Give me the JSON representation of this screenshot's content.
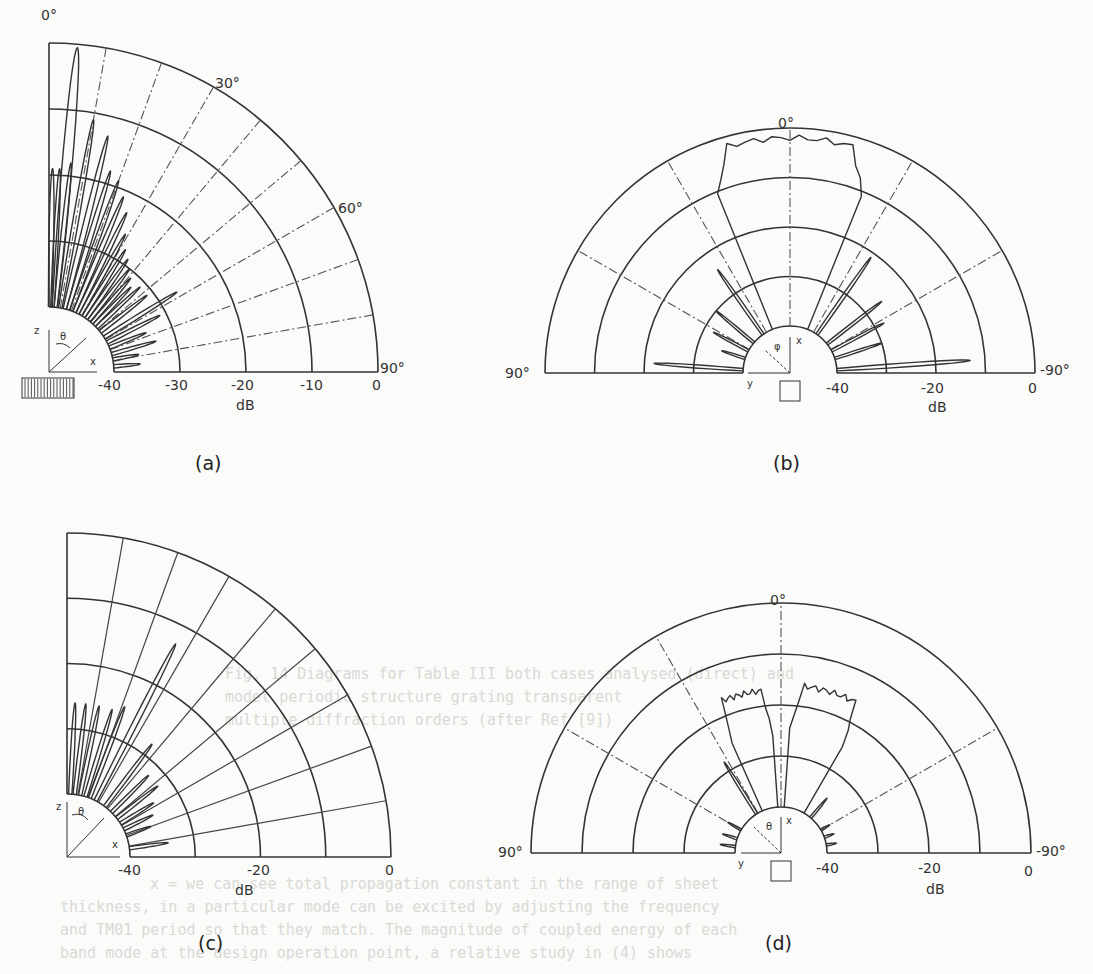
{
  "chart_data": [
    {
      "id": "a",
      "type": "polar",
      "panel_label": "(a)",
      "layout": "quarter",
      "angle_range_deg": [
        0,
        90
      ],
      "angle_labels": [
        "0°",
        "30°",
        "60°",
        "90°"
      ],
      "radial_unit": "dB",
      "radial_ticks": [
        "-40",
        "-30",
        "-20",
        "-10",
        "0"
      ],
      "rlim": [
        -40,
        0
      ],
      "grid": true,
      "inset": {
        "axes": [
          "z",
          "x"
        ],
        "angle": "θ",
        "icon": "hatched-slab"
      },
      "lobes": [
        {
          "theta": 5,
          "db": -0.5
        },
        {
          "theta": 1,
          "db": -19
        },
        {
          "theta": 3,
          "db": -19
        },
        {
          "theta": 6,
          "db": -18
        },
        {
          "theta": 10,
          "db": -11
        },
        {
          "theta": 14,
          "db": -13
        },
        {
          "theta": 17,
          "db": -18
        },
        {
          "theta": 20,
          "db": -19
        },
        {
          "theta": 23,
          "db": -21
        },
        {
          "theta": 26,
          "db": -23
        },
        {
          "theta": 29,
          "db": -26
        },
        {
          "theta": 32,
          "db": -28
        },
        {
          "theta": 35,
          "db": -29
        },
        {
          "theta": 38,
          "db": -30
        },
        {
          "theta": 41,
          "db": -31
        },
        {
          "theta": 44,
          "db": -32
        },
        {
          "theta": 47,
          "db": -31
        },
        {
          "theta": 52,
          "db": -31
        },
        {
          "theta": 58,
          "db": -27
        },
        {
          "theta": 63,
          "db": -31
        },
        {
          "theta": 68,
          "db": -34
        },
        {
          "theta": 74,
          "db": -33
        },
        {
          "theta": 79,
          "db": -36
        },
        {
          "theta": 85,
          "db": -36
        }
      ]
    },
    {
      "id": "b",
      "type": "polar",
      "panel_label": "(b)",
      "layout": "half",
      "angle_range_deg": [
        90,
        -90
      ],
      "angle_labels": [
        "90°",
        "0°",
        "-90°"
      ],
      "radial_unit": "dB",
      "radial_ticks": [
        "-40",
        "-20",
        "0"
      ],
      "rlim": [
        -40,
        0
      ],
      "grid": true,
      "inset": {
        "axes": [
          "x",
          "y"
        ],
        "angle": "φ",
        "icon": "square-aperture"
      },
      "main_beam": {
        "theta_from": -22,
        "theta_to": 22,
        "db": -2
      },
      "lobes": [
        {
          "theta": 35,
          "db": -24
        },
        {
          "theta": 50,
          "db": -30
        },
        {
          "theta": 62,
          "db": -32
        },
        {
          "theta": 72,
          "db": -35
        },
        {
          "theta": 86,
          "db": -22
        },
        {
          "theta": -35,
          "db": -21
        },
        {
          "theta": -52,
          "db": -26
        },
        {
          "theta": -62,
          "db": -28
        },
        {
          "theta": -72,
          "db": -30
        },
        {
          "theta": -86,
          "db": -13
        }
      ]
    },
    {
      "id": "c",
      "type": "polar",
      "panel_label": "(c)",
      "layout": "quarter",
      "angle_range_deg": [
        0,
        90
      ],
      "radial_unit": "dB",
      "radial_ticks": [
        "-40",
        "-20",
        "0"
      ],
      "rlim": [
        -40,
        0
      ],
      "grid": true,
      "inset": {
        "axes": [
          "z",
          "x"
        ],
        "angle": "θ"
      },
      "lobes": [
        {
          "theta": 27,
          "db": -13
        },
        {
          "theta": 3,
          "db": -26
        },
        {
          "theta": 7,
          "db": -26
        },
        {
          "theta": 12,
          "db": -26
        },
        {
          "theta": 17,
          "db": -26
        },
        {
          "theta": 21,
          "db": -25
        },
        {
          "theta": 37,
          "db": -28
        },
        {
          "theta": 45,
          "db": -32
        },
        {
          "theta": 52,
          "db": -32
        },
        {
          "theta": 58,
          "db": -34
        },
        {
          "theta": 64,
          "db": -35
        },
        {
          "theta": 70,
          "db": -36
        },
        {
          "theta": 82,
          "db": -34
        }
      ]
    },
    {
      "id": "d",
      "type": "polar",
      "panel_label": "(d)",
      "layout": "half",
      "angle_range_deg": [
        90,
        -90
      ],
      "angle_labels": [
        "90°",
        "0°",
        "-90°"
      ],
      "radial_unit": "dB",
      "radial_ticks": [
        "-40",
        "-20",
        "0"
      ],
      "rlim": [
        -40,
        0
      ],
      "grid": true,
      "inset": {
        "axes": [
          "x",
          "y"
        ],
        "angle": "θ",
        "icon": "square-aperture"
      },
      "main_beams": [
        {
          "theta_from": 4,
          "theta_to": 24,
          "db": -17
        },
        {
          "theta_from": -4,
          "theta_to": -30,
          "db": -16
        }
      ],
      "lobes": [
        {
          "theta": 32,
          "db": -28
        },
        {
          "theta": 60,
          "db": -37
        },
        {
          "theta": 72,
          "db": -37
        },
        {
          "theta": 82,
          "db": -37
        },
        {
          "theta": -40,
          "db": -35
        },
        {
          "theta": -60,
          "db": -38
        },
        {
          "theta": -70,
          "db": -38
        },
        {
          "theta": -80,
          "db": -38
        }
      ]
    }
  ],
  "labels": {
    "a": {
      "panel": "(a)",
      "deg0": "0°",
      "deg30": "30°",
      "deg60": "60°",
      "deg90": "90°",
      "t40": "-40",
      "t30": "-30",
      "t20": "-20",
      "t10": "-10",
      "t0": "0",
      "unit": "dB",
      "z": "z",
      "x": "x",
      "theta": "θ"
    },
    "b": {
      "panel": "(b)",
      "deg0": "0°",
      "deg90": "90°",
      "degm90": "-90°",
      "t40": "-40",
      "t20": "-20",
      "t0": "0",
      "unit": "dB",
      "x": "x",
      "y": "y",
      "phi": "φ"
    },
    "c": {
      "panel": "(c)",
      "t40": "-40",
      "t20": "-20",
      "t0": "0",
      "unit": "dB",
      "z": "z",
      "x": "x",
      "theta": "θ"
    },
    "d": {
      "panel": "(d)",
      "deg0": "0°",
      "deg90": "90°",
      "degm90": "-90°",
      "t40": "-40",
      "t20": "-20",
      "t0": "0",
      "unit": "dB",
      "x": "x",
      "y": "y",
      "theta": "θ"
    }
  },
  "ghost_text": [
    "Fig. 14  Diagrams for Table III both cases analysed (direct) and",
    "          model periodic structure grating transparent",
    "          multiple diffraction orders (after Ref [9])",
    "x = we can see total propagation constant in the range of sheet",
    "thickness, in a particular mode can be excited by adjusting the frequency",
    "and TM01 period so that they match.  The magnitude of coupled energy of each",
    "band mode at the design operation point, a relative study in (4) shows"
  ]
}
